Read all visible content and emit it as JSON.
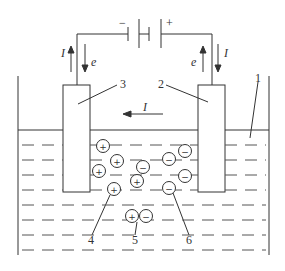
{
  "diagram": {
    "battery": {
      "negative_label": "−",
      "positive_label": "+"
    },
    "arrows": {
      "left_current": "I",
      "left_electron": "e",
      "right_electron": "e",
      "right_current": "I",
      "solution_current": "I"
    },
    "callouts": {
      "container": "1",
      "anode": "2",
      "cathode": "3",
      "cation": "4",
      "ion_pair": "5",
      "anion": "6"
    },
    "ions": {
      "positive_sign": "+",
      "negative_sign": "−"
    },
    "colors": {
      "stroke": "#333333",
      "background": "#ffffff"
    }
  }
}
